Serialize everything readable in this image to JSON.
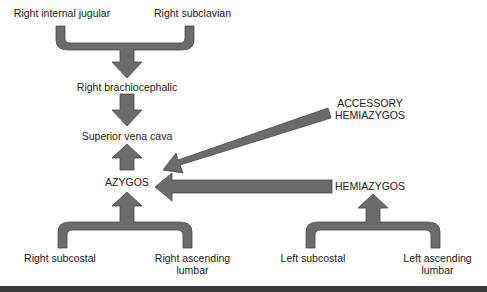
{
  "diagram": {
    "title": "",
    "colors": {
      "arrow_fill": "#6b6b6b",
      "arrow_stroke": "#4a4a4a",
      "text": "#1a1a1a",
      "bottom_bar": "#3a3a3a"
    },
    "nodes": {
      "right_internal_jugular": "Right internal jugular",
      "right_subclavian": "Right subclavian",
      "right_brachiocephalic": "Right brachiocephalic",
      "superior_vena_cava": "Superior vena cava",
      "azygos": "AZYGOS",
      "accessory_hemiazygos": "ACCESSORY\nHEMIAZYGOS",
      "hemiazygos": "HEMIAZYGOS",
      "right_subcostal": "Right subcostal",
      "right_ascending_lumbar": "Right ascending\nlumbar",
      "left_subcostal": "Left subcostal",
      "left_ascending_lumbar": "Left ascending\nlumbar"
    },
    "edges": [
      {
        "from": [
          "Right internal jugular",
          "Right subclavian"
        ],
        "to": "Right brachiocephalic"
      },
      {
        "from": "Right brachiocephalic",
        "to": "Superior vena cava"
      },
      {
        "from": "AZYGOS",
        "to": "Superior vena cava"
      },
      {
        "from": [
          "Right subcostal",
          "Right ascending lumbar"
        ],
        "to": "AZYGOS"
      },
      {
        "from": "ACCESSORY HEMIAZYGOS",
        "to": "AZYGOS"
      },
      {
        "from": "HEMIAZYGOS",
        "to": "AZYGOS"
      },
      {
        "from": [
          "Left subcostal",
          "Left ascending lumbar"
        ],
        "to": "HEMIAZYGOS"
      }
    ]
  }
}
